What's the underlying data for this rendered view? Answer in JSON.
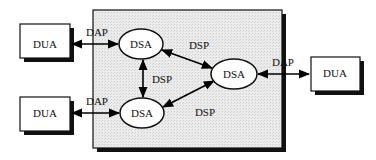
{
  "diagram": {
    "region": {
      "label": "",
      "fill": "#e6e6e6"
    },
    "nodes": {
      "dua_top_left": {
        "label": "DUA"
      },
      "dua_bottom_left": {
        "label": "DUA"
      },
      "dua_right": {
        "label": "DUA"
      },
      "dsa_top": {
        "label": "DSA"
      },
      "dsa_bottom": {
        "label": "DSA"
      },
      "dsa_right": {
        "label": "DSA"
      }
    },
    "edges": {
      "dap_top": {
        "label": "DAP",
        "from": "DUA (top-left)",
        "to": "DSA (top)"
      },
      "dap_bottom": {
        "label": "DAP",
        "from": "DUA (bottom-left)",
        "to": "DSA (bottom)"
      },
      "dap_right": {
        "label": "DAP",
        "from": "DSA (right)",
        "to": "DUA (right)"
      },
      "dsp_top_right": {
        "label": "DSP",
        "from": "DSA (top)",
        "to": "DSA (right)"
      },
      "dsp_vertical": {
        "label": "DSP",
        "from": "DSA (top)",
        "to": "DSA (bottom)"
      },
      "dsp_bottom_right": {
        "label": "DSP",
        "from": "DSA (bottom)",
        "to": "DSA (right)"
      }
    }
  }
}
